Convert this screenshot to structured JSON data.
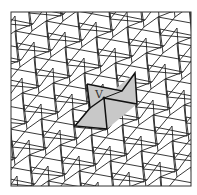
{
  "figure": {
    "type": "periodic tiling diagram",
    "frame": {
      "x": 11,
      "y": 12,
      "width": 180,
      "height": 174
    },
    "vertex_label": "V",
    "vertex_position": [
      103,
      99
    ],
    "highlight_color": "#c8c8c8",
    "line_color": "#222222",
    "lattice": {
      "a": [
        31,
        -10
      ],
      "b": [
        -12,
        36
      ]
    }
  }
}
